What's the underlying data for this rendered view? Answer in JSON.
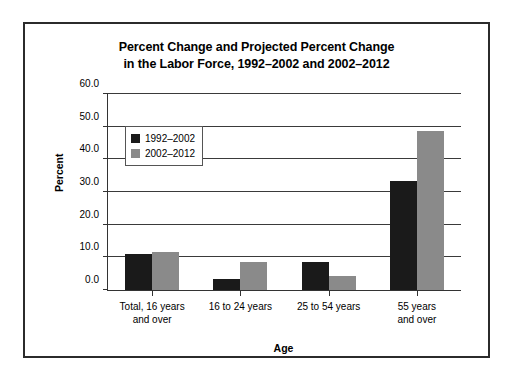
{
  "chart_data": {
    "type": "bar",
    "title": "Percent Change and Projected Percent Change in the Labor Force, 1992–2002 and 2002–2012",
    "title_lines": [
      "Percent Change and Projected Percent Change",
      "in the Labor Force, 1992–2002 and 2002–2012"
    ],
    "xlabel": "Age",
    "ylabel": "Percent",
    "ylim": [
      0,
      60
    ],
    "ytick_values": [
      0,
      10,
      20,
      30,
      40,
      50,
      60
    ],
    "ytick_labels": [
      "0.0",
      "10.0",
      "20.0",
      "30.0",
      "40.0",
      "50.0",
      "60.0"
    ],
    "grid": true,
    "legend_position": "upper-left-inside",
    "categories": [
      "Total, 16 years and over",
      "16 to 24 years",
      "25 to 54 years",
      "55 years and over"
    ],
    "category_lines": [
      [
        "Total, 16 years",
        "and over"
      ],
      [
        "16 to 24 years",
        ""
      ],
      [
        "25 to 54 years",
        ""
      ],
      [
        "55 years",
        "and over"
      ]
    ],
    "series": [
      {
        "name": "1992–2002",
        "color": "#1a1a1a",
        "values": [
          11.0,
          3.4,
          8.7,
          33.4
        ]
      },
      {
        "name": "2002–2012",
        "color": "#8a8a8a",
        "values": [
          11.7,
          8.6,
          4.4,
          48.8
        ]
      }
    ]
  }
}
